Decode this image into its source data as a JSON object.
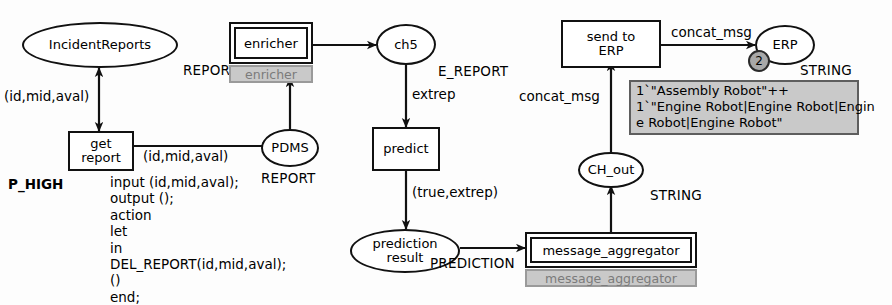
{
  "diagram": {
    "places": [
      {
        "id": "incident_reports",
        "label": "IncidentReports",
        "type": "REPORT"
      },
      {
        "id": "pdms",
        "label": "PDMS",
        "type": "REPORT"
      },
      {
        "id": "ch5",
        "label": "ch5",
        "type": "E_REPORT"
      },
      {
        "id": "prediction_result",
        "label": "prediction\nresult",
        "line1": "prediction",
        "line2": "result",
        "type": "PREDICTION"
      },
      {
        "id": "ch_out",
        "label": "CH_out",
        "type": "STRING"
      },
      {
        "id": "erp",
        "label": "ERP",
        "type": "STRING",
        "token_count": "2"
      }
    ],
    "transitions": [
      {
        "id": "get_report",
        "line1": "get",
        "line2": "report",
        "priority": "P_HIGH"
      },
      {
        "id": "predict",
        "label": "predict"
      },
      {
        "id": "send_to_erp",
        "line1": "send to",
        "line2": "ERP"
      }
    ],
    "substitution_transitions": [
      {
        "id": "enricher",
        "label": "enricher",
        "tag": "enricher"
      },
      {
        "id": "message_aggregator",
        "label": "message_aggregator",
        "tag": "message_aggregator"
      }
    ],
    "arc_inscriptions": {
      "incident_to_get_report": "(id,mid,aval)",
      "get_report_to_pdms": "(id,mid,aval)",
      "ch5_to_predict": "extrep",
      "predict_to_prediction_result": "(true,extrep)",
      "ch_out_to_send_to_erp": "concat_msg",
      "send_to_erp_to_erp": "concat_msg"
    },
    "code_block": {
      "lines": [
        "input (id,mid,aval);",
        "output ();",
        "action",
        "let",
        "in",
        "DEL_REPORT(id,mid,aval);",
        "()",
        "end;"
      ],
      "text": "input (id,mid,aval);\noutput ();\naction\nlet\nin\nDEL_REPORT(id,mid,aval);\n()\nend;"
    },
    "marking_annotation": {
      "lines": [
        "1`\"Assembly Robot\"++",
        "1`\"Engine Robot|Engine Robot|Engin",
        "e Robot|Engine Robot\""
      ],
      "text": "1`\"Assembly Robot\"++\n1`\"Engine Robot|Engine Robot|Engin\ne Robot|Engine Robot\""
    },
    "colors": {
      "stroke": "#111111",
      "page_background": "#fdfdfd",
      "substitution_tag_fill": "#c9c9c9",
      "substitution_tag_text": "#7b7b7b",
      "marking_fill": "#c9c9c9",
      "token_badge_fill": "#a8a8a8"
    }
  }
}
